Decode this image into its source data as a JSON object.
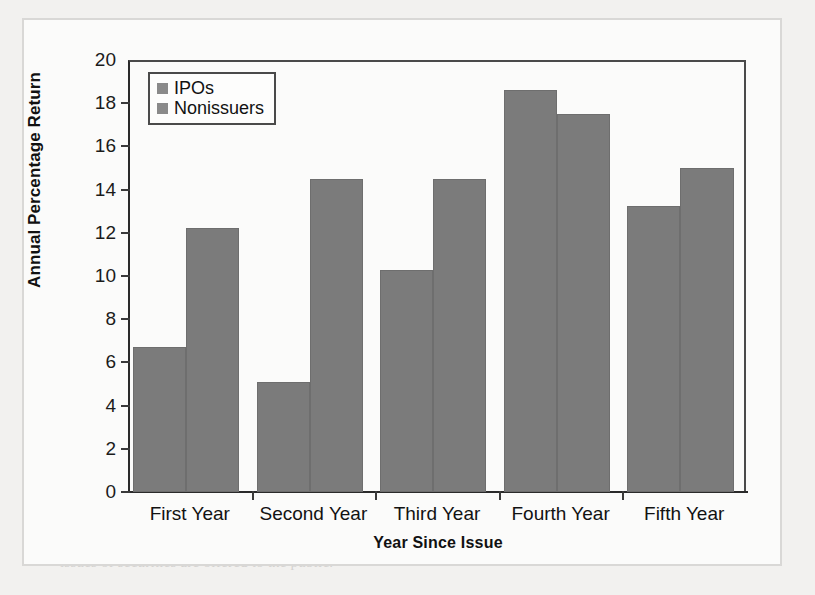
{
  "chart_data": {
    "type": "bar",
    "title": "",
    "xlabel": "Year Since Issue",
    "ylabel": "Annual Percentage Return",
    "categories": [
      "First Year",
      "Second Year",
      "Third Year",
      "Fourth Year",
      "Fifth Year"
    ],
    "series": [
      {
        "name": "IPOs",
        "color": "#7b7b7b",
        "values": [
          6.7,
          5.1,
          10.3,
          18.6,
          13.25
        ]
      },
      {
        "name": "Nonissuers",
        "color": "#7b7b7b",
        "values": [
          12.2,
          14.5,
          14.5,
          17.5,
          15.0
        ]
      }
    ],
    "ylim": [
      0,
      20
    ],
    "ytick_step": 2,
    "yticks": [
      "20",
      "18",
      "16",
      "14",
      "12",
      "10",
      "8",
      "6",
      "4",
      "2",
      "0"
    ],
    "grid": false,
    "legend_position": "top-left"
  },
  "legend": {
    "entries": [
      {
        "label": "IPOs"
      },
      {
        "label": "Nonissuers"
      }
    ]
  },
  "axes": {
    "y_title": "Annual Percentage Return",
    "x_title": "Year Since Issue"
  },
  "ghost_text": {
    "lines": [
      {
        "x": 88,
        "y": 30,
        "size": 15,
        "head": true,
        "text": "Direct Search Markets"
      },
      {
        "x": 330,
        "y": 30,
        "size": 15,
        "head": false,
        "text": "A direct search mar-"
      },
      {
        "x": 60,
        "y": 52,
        "size": 15,
        "head": false,
        "text": "ket is the least organized market. Buyers and"
      },
      {
        "x": 60,
        "y": 74,
        "size": 15,
        "head": false,
        "text": "sellers must seek each other out directly. An ex-"
      },
      {
        "x": 60,
        "y": 96,
        "size": 15,
        "head": false,
        "text": "ample of a transaction in such a market is the sale"
      },
      {
        "x": 60,
        "y": 118,
        "size": 15,
        "head": false,
        "text": "of a used refrigerator where the seller advertises"
      },
      {
        "x": 60,
        "y": 140,
        "size": 15,
        "head": false,
        "text": "for sale in local newspapers. Such markets are"
      },
      {
        "x": 60,
        "y": 162,
        "size": 15,
        "head": false,
        "text": "characterized by sporadic participation and"
      },
      {
        "x": 60,
        "y": 184,
        "size": 15,
        "head": false,
        "text": "nonstandard goods."
      },
      {
        "x": 88,
        "y": 250,
        "size": 15,
        "head": true,
        "text": "Brokered Markets"
      },
      {
        "x": 300,
        "y": 250,
        "size": 15,
        "head": false,
        "text": "The next level of"
      },
      {
        "x": 60,
        "y": 272,
        "size": 15,
        "head": false,
        "text": "organization is a brokered market. In markets"
      },
      {
        "x": 60,
        "y": 294,
        "size": 15,
        "head": false,
        "text": "where trading in a good is active, brokers find it"
      },
      {
        "x": 60,
        "y": 316,
        "size": 15,
        "head": false,
        "text": "profitable to offer search services to buyers and"
      },
      {
        "x": 60,
        "y": 338,
        "size": 15,
        "head": false,
        "text": "sellers. A good example is the real estate market,"
      },
      {
        "x": 60,
        "y": 360,
        "size": 15,
        "head": false,
        "text": "where economies of scale in searches for avail-"
      },
      {
        "x": 60,
        "y": 382,
        "size": 15,
        "head": false,
        "text": "able homes and for prospective buyers make it"
      },
      {
        "x": 60,
        "y": 404,
        "size": 15,
        "head": false,
        "text": "worthwhile for participants to pay brokers to"
      },
      {
        "x": 60,
        "y": 426,
        "size": 15,
        "head": false,
        "text": "conduct the searches. Brokers in particular mar-"
      },
      {
        "x": 60,
        "y": 448,
        "size": 15,
        "head": false,
        "text": "kets develop specialized knowledge on valuing"
      },
      {
        "x": 60,
        "y": 470,
        "size": 15,
        "head": false,
        "text": "assets traded in that market."
      },
      {
        "x": 88,
        "y": 510,
        "size": 15,
        "head": false,
        "text": "Perhaps the most important brokered invest-"
      },
      {
        "x": 60,
        "y": 532,
        "size": 15,
        "head": false,
        "text": "ment market is the primary market, where new"
      },
      {
        "x": 60,
        "y": 554,
        "size": 15,
        "head": false,
        "text": "issues of securities are offered to the public."
      }
    ]
  }
}
